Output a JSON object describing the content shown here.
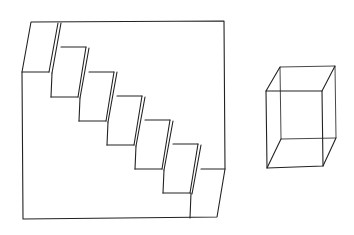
{
  "figure": {
    "background": "#ffffff",
    "stroke": "#222222"
  },
  "staircase": {
    "step_count": 6
  },
  "cube": {
    "type": "wireframe-prism"
  }
}
